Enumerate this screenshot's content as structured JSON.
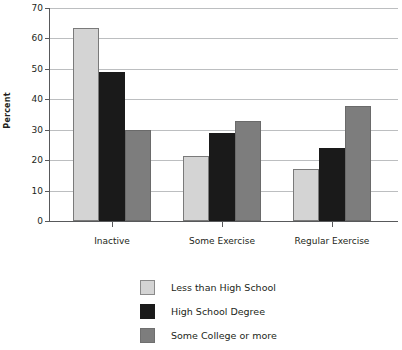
{
  "chart_data": {
    "type": "bar",
    "title": "",
    "xlabel": "",
    "ylabel": "Percent",
    "ylim": [
      0,
      70
    ],
    "yticks": [
      0,
      10,
      20,
      30,
      40,
      50,
      60,
      70
    ],
    "ytick_labels": [
      "0",
      "10",
      "20",
      "30",
      "40",
      "50",
      "60",
      "70"
    ],
    "grid": true,
    "legend_position": "bottom-center",
    "categories": [
      "Inactive",
      "Some Exercise",
      "Regular Exercise"
    ],
    "series": [
      {
        "name": "Less than High School",
        "color": "#d4d4d4",
        "values": [
          63.4,
          21.5,
          17.1
        ]
      },
      {
        "name": "High School Degree",
        "color": "#1a1a1a",
        "values": [
          48.9,
          28.8,
          24.0
        ]
      },
      {
        "name": "Some College or more",
        "color": "#7d7d7d",
        "values": [
          29.9,
          32.8,
          37.9
        ]
      }
    ]
  },
  "axis": {
    "y_axis_title": "Percent"
  },
  "legend": {
    "entries": [
      {
        "label": "Less than High School"
      },
      {
        "label": "High School Degree"
      },
      {
        "label": "Some College or more"
      }
    ]
  }
}
